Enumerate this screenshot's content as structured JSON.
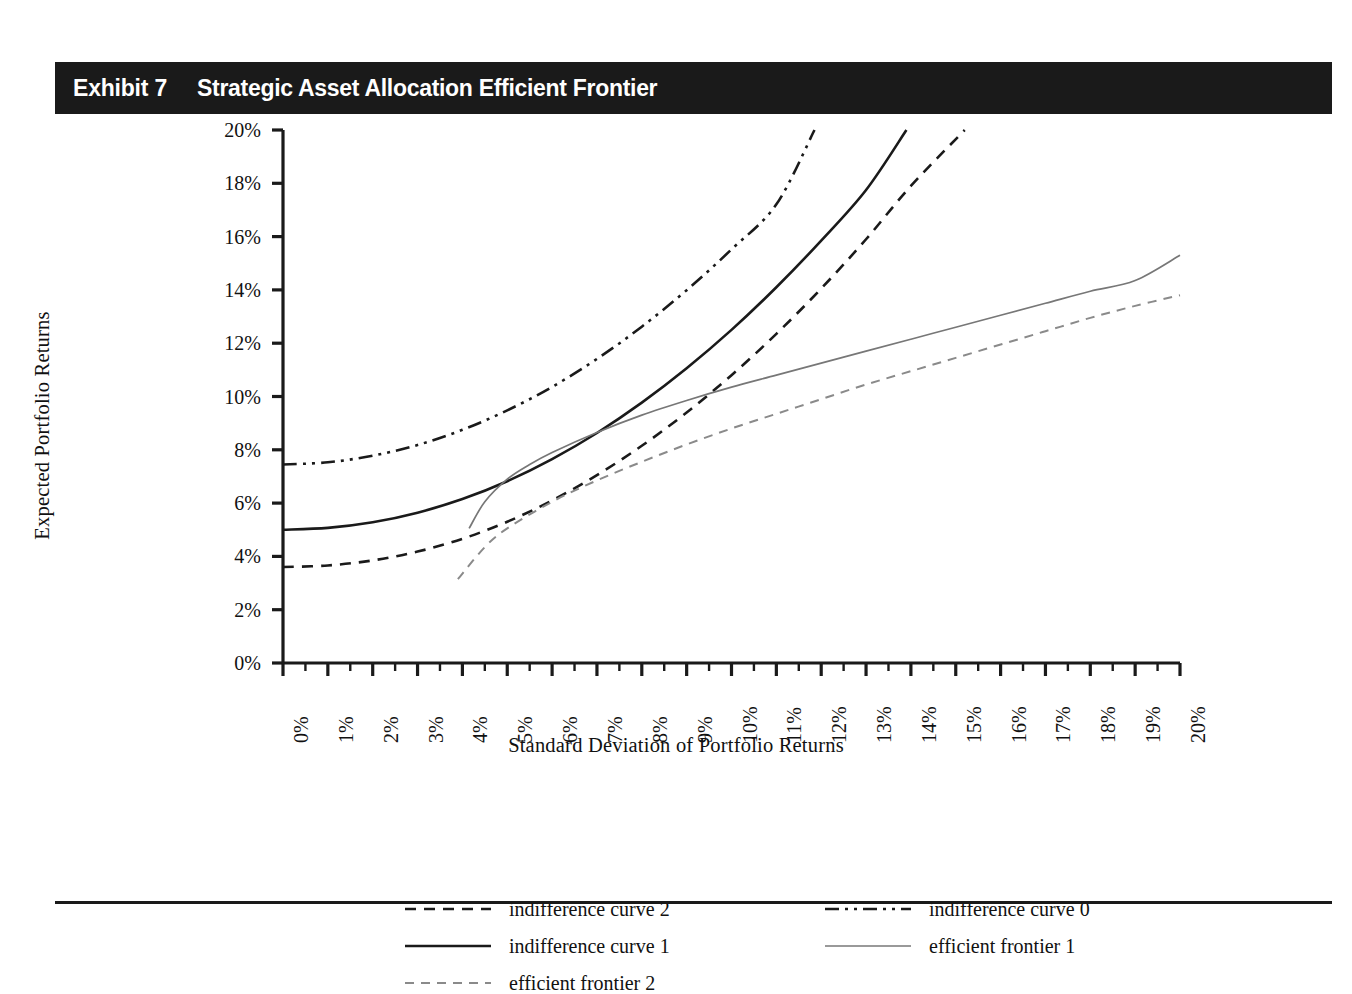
{
  "exhibit": {
    "number": "Exhibit 7",
    "title": "Strategic Asset Allocation Efficient Frontier"
  },
  "chart_data": {
    "type": "line",
    "title": "Strategic Asset Allocation Efficient Frontier",
    "xlabel": "Standard Deviation of Portfolio Returns",
    "ylabel": "Expected Portfolio Returns",
    "xlim": [
      0,
      20
    ],
    "ylim": [
      0,
      20
    ],
    "xtick_labels": [
      "0%",
      "1%",
      "2%",
      "3%",
      "4%",
      "5%",
      "6%",
      "7%",
      "8%",
      "9%",
      "10%",
      "11%",
      "12%",
      "13%",
      "14%",
      "15%",
      "16%",
      "17%",
      "18%",
      "19%",
      "20%"
    ],
    "ytick_labels": [
      "0%",
      "2%",
      "4%",
      "6%",
      "8%",
      "10%",
      "12%",
      "14%",
      "16%",
      "18%",
      "20%"
    ],
    "xticks": [
      0,
      1,
      2,
      3,
      4,
      5,
      6,
      7,
      8,
      9,
      10,
      11,
      12,
      13,
      14,
      15,
      16,
      17,
      18,
      19,
      20
    ],
    "yticks": [
      0,
      2,
      4,
      6,
      8,
      10,
      12,
      14,
      16,
      18,
      20
    ],
    "minor_xticks": true,
    "grid": false,
    "legend_position": "below-plot",
    "series": [
      {
        "name": "indifference curve 2",
        "style": "dashed",
        "color": "#1a1a1a",
        "width": 2.6,
        "x": [
          0,
          1,
          2,
          3,
          4,
          5,
          6,
          7,
          8,
          9,
          10,
          11,
          12,
          13,
          14,
          15.2
        ],
        "y": [
          3.6,
          3.66,
          3.85,
          4.18,
          4.66,
          5.3,
          6.1,
          7.05,
          8.15,
          9.4,
          10.8,
          12.35,
          14.05,
          15.9,
          17.9,
          20.0
        ]
      },
      {
        "name": "indifference curve 1",
        "style": "solid",
        "color": "#1a1a1a",
        "width": 2.6,
        "x": [
          0,
          1,
          2,
          3,
          4,
          5,
          6,
          7,
          8,
          9,
          10,
          11,
          12,
          13,
          13.9
        ],
        "y": [
          5.0,
          5.07,
          5.28,
          5.64,
          6.15,
          6.82,
          7.65,
          8.63,
          9.77,
          11.06,
          12.5,
          14.1,
          15.85,
          17.75,
          20.0
        ]
      },
      {
        "name": "indifference curve 0",
        "style": "dashdotdot",
        "color": "#1a1a1a",
        "width": 2.6,
        "x": [
          0,
          1,
          2,
          3,
          4,
          5,
          6,
          7,
          8,
          9,
          10,
          11,
          11.85
        ],
        "y": [
          7.45,
          7.53,
          7.78,
          8.18,
          8.75,
          9.48,
          10.36,
          11.41,
          12.62,
          13.99,
          15.52,
          17.21,
          20.0
        ]
      },
      {
        "name": "efficient frontier 1",
        "style": "solid",
        "color": "#777777",
        "width": 1.7,
        "x": [
          4.15,
          4.5,
          5,
          5.5,
          6,
          7,
          8,
          9,
          10,
          11,
          12,
          13,
          14,
          15,
          16,
          17,
          18,
          19,
          20
        ],
        "y": [
          5.05,
          6.05,
          6.9,
          7.45,
          7.9,
          8.65,
          9.3,
          9.85,
          10.35,
          10.8,
          11.25,
          11.7,
          12.15,
          12.6,
          13.05,
          13.5,
          13.95,
          14.35,
          15.3
        ]
      },
      {
        "name": "efficient frontier 2",
        "style": "dashed",
        "color": "#8a8a8a",
        "width": 2.0,
        "x": [
          3.9,
          4.5,
          5,
          6,
          7,
          8,
          9,
          10,
          11,
          12,
          13,
          14,
          15,
          16,
          17,
          18,
          19,
          20
        ],
        "y": [
          3.15,
          4.35,
          5.05,
          6.05,
          6.85,
          7.55,
          8.2,
          8.8,
          9.35,
          9.9,
          10.45,
          10.95,
          11.45,
          11.95,
          12.45,
          12.95,
          13.4,
          13.8
        ]
      }
    ]
  },
  "legend": {
    "items": [
      {
        "label": "indifference curve 2",
        "style": "dashed",
        "color": "#1a1a1a",
        "width": 2.6,
        "col": 0,
        "row": 0
      },
      {
        "label": "indifference curve 1",
        "style": "solid",
        "color": "#1a1a1a",
        "width": 2.6,
        "col": 0,
        "row": 1
      },
      {
        "label": "efficient frontier 2",
        "style": "dashed",
        "color": "#8a8a8a",
        "width": 2.0,
        "col": 0,
        "row": 2
      },
      {
        "label": "indifference curve 0",
        "style": "dashdotdot",
        "color": "#1a1a1a",
        "width": 2.6,
        "col": 1,
        "row": 0
      },
      {
        "label": "efficient frontier 1",
        "style": "solid",
        "color": "#777777",
        "width": 1.7,
        "col": 1,
        "row": 1
      }
    ]
  },
  "colors": {
    "header_bg": "#1a1a1a",
    "header_text": "#ffffff",
    "axis": "#1a1a1a",
    "page_bg": "#ffffff"
  }
}
